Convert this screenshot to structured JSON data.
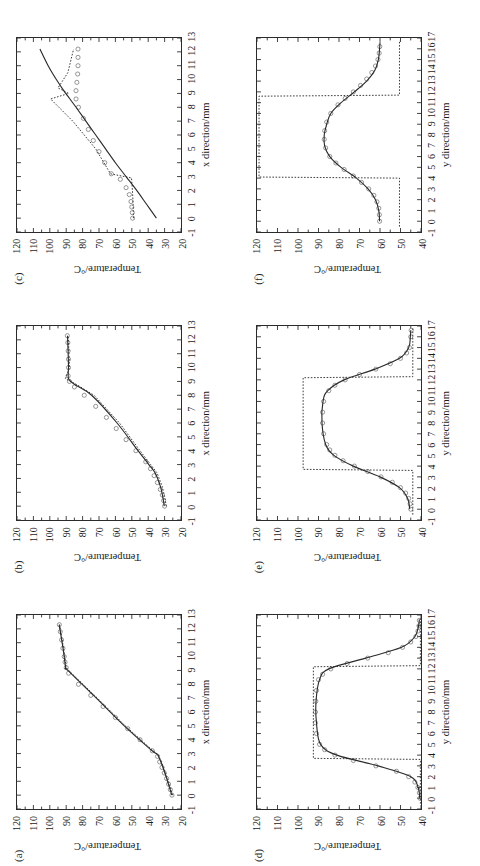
{
  "figure": {
    "orientation": "rotated-90-ccw",
    "panel_count": 6,
    "legend": {
      "entries": [
        {
          "label": "COMSOL",
          "style": "circle-marker",
          "color": "#6f6f6f"
        },
        {
          "label": "One-dimensional",
          "style": "dotted-line",
          "color": "#3a3a3a"
        },
        {
          "label": "Bi-layer model",
          "style": "solid-line",
          "color": "#2b2b2b"
        }
      ]
    },
    "axis_titles": {
      "y": "Temperature/°C",
      "x_top_row": "x direction/mm",
      "x_bottom_row": "y direction/mm"
    }
  },
  "chart_data": [
    {
      "id": "a",
      "panel_label": "(a)",
      "type": "line",
      "title": "",
      "annotation": "t = 0.1 mm",
      "xlabel": "x direction/mm",
      "ylabel": "Temperature/°C",
      "xlim": [
        -1,
        13
      ],
      "ylim": [
        20,
        120
      ],
      "xticks": [
        -1,
        0,
        1,
        2,
        3,
        4,
        5,
        6,
        7,
        8,
        9,
        10,
        11,
        12,
        13
      ],
      "yticks": [
        20,
        30,
        40,
        50,
        60,
        70,
        80,
        90,
        100,
        110,
        120
      ],
      "grid": false,
      "legend_position": "upper-left",
      "series": [
        {
          "name": "COMSOL",
          "style": "circle-marker",
          "x": [
            0.0,
            0.4,
            0.8,
            1.2,
            1.6,
            2.0,
            2.4,
            2.8,
            3.2,
            4.0,
            4.8,
            5.6,
            6.4,
            7.2,
            8.0,
            8.8,
            9.2,
            9.6,
            10.0,
            10.6,
            11.2,
            11.8,
            12.3
          ],
          "values": [
            25.5,
            26.5,
            27.6,
            28.8,
            30.2,
            31.6,
            33.0,
            34.3,
            37.5,
            45.0,
            52.5,
            60.0,
            67.5,
            75.0,
            82.5,
            88.5,
            90.0,
            90.7,
            91.2,
            92.0,
            92.8,
            93.6,
            94.2
          ]
        },
        {
          "name": "One-dimensional",
          "style": "dotted-line",
          "x": [
            0.0,
            1.0,
            2.0,
            2.9,
            3.2,
            5.0,
            7.0,
            9.0,
            9.2,
            10.5,
            12.3
          ],
          "values": [
            25.0,
            27.7,
            30.6,
            33.8,
            37.0,
            54.0,
            71.0,
            88.5,
            90.0,
            91.5,
            94.0
          ]
        },
        {
          "name": "Bi-layer model",
          "style": "solid-line",
          "x": [
            0.0,
            1.0,
            2.0,
            2.9,
            3.2,
            5.0,
            7.0,
            9.0,
            9.2,
            10.5,
            12.3
          ],
          "values": [
            25.6,
            28.2,
            31.0,
            34.2,
            37.6,
            54.6,
            71.6,
            89.0,
            90.3,
            91.8,
            94.3
          ]
        }
      ]
    },
    {
      "id": "b",
      "panel_label": "(b)",
      "type": "line",
      "title": "",
      "annotation": "t = 0.5 mm",
      "xlabel": "x direction/mm",
      "ylabel": "Temperature/°C",
      "xlim": [
        -1,
        13
      ],
      "ylim": [
        20,
        120
      ],
      "xticks": [
        -1,
        0,
        1,
        2,
        3,
        4,
        5,
        6,
        7,
        8,
        9,
        10,
        11,
        12,
        13
      ],
      "yticks": [
        20,
        30,
        40,
        50,
        60,
        70,
        80,
        90,
        100,
        110,
        120
      ],
      "grid": false,
      "legend_position": "upper-left",
      "series": [
        {
          "name": "COMSOL",
          "style": "circle-marker",
          "x": [
            0.0,
            0.4,
            0.8,
            1.2,
            1.7,
            2.2,
            2.7,
            3.2,
            4.0,
            4.8,
            5.6,
            6.4,
            7.2,
            8.0,
            8.6,
            9.0,
            9.4,
            10.0,
            10.6,
            11.2,
            11.8,
            12.3
          ],
          "values": [
            30.0,
            30.6,
            31.4,
            32.6,
            34.4,
            36.4,
            38.6,
            41.5,
            47.5,
            53.5,
            59.5,
            65.5,
            72.0,
            79.0,
            85.0,
            88.0,
            88.8,
            88.6,
            88.6,
            88.8,
            89.0,
            89.3
          ]
        },
        {
          "name": "One-dimensional",
          "style": "dotted-line",
          "x": [
            0.0,
            0.6,
            1.4,
            2.4,
            3.0,
            4.0,
            6.0,
            8.0,
            8.8,
            9.2,
            10.0,
            11.0,
            12.3
          ],
          "values": [
            29.0,
            29.8,
            31.4,
            34.6,
            38.5,
            45.0,
            57.5,
            73.0,
            84.0,
            90.5,
            88.0,
            88.3,
            88.8
          ]
        },
        {
          "name": "Bi-layer model",
          "style": "solid-line",
          "x": [
            0.0,
            0.6,
            1.4,
            2.4,
            3.0,
            4.0,
            6.0,
            8.0,
            8.8,
            9.2,
            10.0,
            11.0,
            12.3
          ],
          "values": [
            30.2,
            31.0,
            32.5,
            35.8,
            39.6,
            46.2,
            59.0,
            74.5,
            85.0,
            88.6,
            88.6,
            88.8,
            89.2
          ]
        }
      ]
    },
    {
      "id": "c",
      "panel_label": "(c)",
      "type": "line",
      "title": "",
      "annotation": "t = 2.0 mm",
      "xlabel": "x direction/mm",
      "ylabel": "Temperature/°C",
      "xlim": [
        -1,
        13
      ],
      "ylim": [
        20,
        120
      ],
      "xticks": [
        -1,
        0,
        1,
        2,
        3,
        4,
        5,
        6,
        7,
        8,
        9,
        10,
        11,
        12,
        13
      ],
      "yticks": [
        20,
        30,
        40,
        50,
        60,
        70,
        80,
        90,
        100,
        110,
        120
      ],
      "grid": false,
      "legend_position": "upper-left",
      "series": [
        {
          "name": "COMSOL",
          "style": "circle-marker",
          "x": [
            0.0,
            0.4,
            0.8,
            1.2,
            1.7,
            2.2,
            2.8,
            3.2,
            4.0,
            4.8,
            5.6,
            6.4,
            7.2,
            8.0,
            8.6,
            9.2,
            9.8,
            10.4,
            11.0,
            11.6,
            12.2
          ],
          "values": [
            49.5,
            49.7,
            50.0,
            50.5,
            51.5,
            53.5,
            57.0,
            62.5,
            66.5,
            70.0,
            73.5,
            76.5,
            79.5,
            82.5,
            84.0,
            84.0,
            83.5,
            83.0,
            82.8,
            82.8,
            82.8
          ]
        },
        {
          "name": "One-dimensional",
          "style": "dotted-line",
          "x": [
            0.0,
            1.0,
            2.0,
            2.9,
            3.2,
            5.0,
            7.0,
            8.6,
            9.0,
            9.4,
            10.5,
            12.2
          ],
          "values": [
            49.0,
            49.2,
            49.6,
            50.2,
            63.0,
            72.0,
            86.0,
            99.5,
            88.5,
            95.0,
            89.0,
            85.5
          ]
        },
        {
          "name": "Bi-layer model",
          "style": "solid-line",
          "x": [
            0.0,
            1.0,
            2.0,
            3.0,
            4.0,
            5.0,
            6.0,
            7.0,
            8.0,
            8.8,
            9.2,
            10.0,
            11.0,
            12.2
          ],
          "values": [
            35.0,
            41.0,
            47.0,
            53.5,
            60.0,
            66.0,
            72.0,
            78.0,
            84.0,
            89.0,
            91.5,
            96.0,
            101.0,
            106.0
          ]
        }
      ]
    },
    {
      "id": "d",
      "panel_label": "(d)",
      "type": "line",
      "title": "",
      "annotation": "t = 0.1 mm",
      "xlabel": "y direction/mm",
      "ylabel": "Temperature/°C",
      "xlim": [
        -1,
        17
      ],
      "ylim": [
        40,
        120
      ],
      "xticks": [
        -1,
        0,
        1,
        2,
        3,
        4,
        5,
        6,
        7,
        8,
        9,
        10,
        11,
        12,
        13,
        14,
        15,
        16,
        17
      ],
      "yticks": [
        40,
        50,
        60,
        70,
        80,
        90,
        100,
        110,
        120
      ],
      "grid": false,
      "legend_position": "upper-left",
      "series": [
        {
          "name": "COMSOL",
          "style": "circle-marker",
          "x": [
            0.0,
            0.5,
            1.0,
            1.5,
            2.0,
            2.5,
            3.0,
            3.5,
            4.0,
            4.5,
            5.0,
            6.0,
            7.0,
            8.0,
            9.0,
            10.0,
            11.0,
            11.5,
            12.0,
            12.5,
            13.0,
            13.5,
            14.0,
            14.5,
            15.0,
            15.5,
            16.0,
            16.5
          ],
          "values": [
            40.5,
            40.8,
            41.5,
            43.0,
            46.0,
            52.0,
            62.0,
            73.0,
            82.0,
            87.0,
            89.5,
            91.0,
            91.5,
            91.5,
            91.3,
            91.0,
            90.0,
            88.0,
            84.0,
            76.0,
            66.0,
            56.0,
            49.0,
            45.0,
            42.5,
            41.5,
            41.0,
            40.8
          ]
        },
        {
          "name": "One-dimensional",
          "style": "dotted-line",
          "x": [
            -0.5,
            3.6,
            3.7,
            12.2,
            12.3,
            16.8
          ],
          "values": [
            40.3,
            40.3,
            92.5,
            92.5,
            40.3,
            40.3
          ]
        },
        {
          "name": "Bi-layer model",
          "style": "solid-line",
          "x": [
            0.0,
            1.0,
            2.0,
            3.0,
            4.0,
            5.0,
            7.0,
            9.0,
            11.0,
            12.0,
            13.0,
            14.0,
            15.0,
            16.0,
            16.6
          ],
          "values": [
            40.6,
            41.4,
            45.0,
            61.0,
            81.0,
            89.0,
            91.0,
            91.2,
            89.5,
            85.0,
            67.0,
            49.5,
            43.0,
            41.2,
            40.8
          ]
        }
      ]
    },
    {
      "id": "e",
      "panel_label": "(e)",
      "type": "line",
      "title": "",
      "annotation": "t = 0.5 mm",
      "xlabel": "y direction/mm",
      "ylabel": "Temperature/°C",
      "xlim": [
        -1,
        17
      ],
      "ylim": [
        40,
        120
      ],
      "xticks": [
        -1,
        0,
        1,
        2,
        3,
        4,
        5,
        6,
        7,
        8,
        9,
        10,
        11,
        12,
        13,
        14,
        15,
        16,
        17
      ],
      "yticks": [
        40,
        50,
        60,
        70,
        80,
        90,
        100,
        110,
        120
      ],
      "grid": false,
      "legend_position": "upper-left",
      "series": [
        {
          "name": "COMSOL",
          "style": "circle-marker",
          "x": [
            0.0,
            0.5,
            1.0,
            1.5,
            2.0,
            2.5,
            3.0,
            3.5,
            4.0,
            4.5,
            5.0,
            5.5,
            6.0,
            7.0,
            8.0,
            9.0,
            10.0,
            11.0,
            11.5,
            12.0,
            12.5,
            13.0,
            13.5,
            14.0,
            14.5,
            15.0,
            16.0,
            16.6
          ],
          "values": [
            45.0,
            45.3,
            46.0,
            47.5,
            50.0,
            54.0,
            59.5,
            66.0,
            72.5,
            78.0,
            82.0,
            84.5,
            86.0,
            87.5,
            88.0,
            88.0,
            87.5,
            85.0,
            82.0,
            77.0,
            70.0,
            62.0,
            55.0,
            50.0,
            47.0,
            45.6,
            45.0,
            44.8
          ]
        },
        {
          "name": "One-dimensional",
          "style": "dotted-line",
          "x": [
            -0.5,
            3.6,
            3.7,
            12.2,
            12.3,
            16.8
          ],
          "values": [
            44.0,
            44.0,
            97.5,
            97.5,
            44.0,
            44.0
          ]
        },
        {
          "name": "Bi-layer model",
          "style": "solid-line",
          "x": [
            0.0,
            1.0,
            2.0,
            3.0,
            4.0,
            5.0,
            6.0,
            8.0,
            10.0,
            11.0,
            12.0,
            13.0,
            14.0,
            15.0,
            16.0,
            16.6
          ],
          "values": [
            45.5,
            46.5,
            50.5,
            60.0,
            73.0,
            82.5,
            86.5,
            88.3,
            87.8,
            85.5,
            77.5,
            62.5,
            50.5,
            46.0,
            45.2,
            45.0
          ]
        }
      ]
    },
    {
      "id": "f",
      "panel_label": "(f)",
      "type": "line",
      "title": "",
      "annotation": "t = 2.0 mm",
      "xlabel": "y direction/mm",
      "ylabel": "Temperature/°C",
      "xlim": [
        -1,
        17
      ],
      "ylim": [
        40,
        120
      ],
      "xticks": [
        -1,
        0,
        1,
        2,
        3,
        4,
        5,
        6,
        7,
        8,
        9,
        10,
        11,
        12,
        13,
        14,
        15,
        16,
        17
      ],
      "yticks": [
        40,
        50,
        60,
        70,
        80,
        90,
        100,
        110,
        120
      ],
      "grid": false,
      "legend_position": "upper-left",
      "series": [
        {
          "name": "COMSOL",
          "style": "circle-marker",
          "x": [
            0.0,
            0.6,
            1.2,
            1.8,
            2.4,
            3.0,
            3.6,
            4.2,
            4.8,
            5.4,
            6.0,
            6.8,
            7.6,
            8.4,
            9.2,
            10.0,
            10.8,
            11.4,
            12.0,
            12.6,
            13.2,
            13.8,
            14.4,
            15.0,
            15.6,
            16.2
          ],
          "values": [
            60.2,
            60.3,
            60.6,
            61.5,
            63.0,
            65.5,
            69.0,
            73.0,
            77.5,
            81.5,
            84.5,
            86.5,
            87.2,
            87.0,
            86.0,
            84.0,
            80.5,
            77.0,
            73.0,
            69.5,
            66.5,
            64.0,
            62.2,
            61.0,
            60.4,
            60.1
          ]
        },
        {
          "name": "One-dimensional",
          "style": "dotted-line",
          "x": [
            -0.5,
            4.0,
            4.1,
            11.6,
            11.7,
            16.8
          ],
          "values": [
            50.5,
            50.5,
            119.0,
            119.0,
            50.5,
            50.5
          ]
        },
        {
          "name": "Bi-layer model",
          "style": "solid-line",
          "x": [
            0.0,
            1.0,
            2.0,
            3.0,
            4.0,
            5.0,
            6.0,
            7.0,
            8.0,
            9.0,
            10.0,
            11.0,
            12.0,
            13.0,
            14.0,
            15.0,
            16.0,
            16.6
          ],
          "values": [
            60.2,
            60.6,
            62.2,
            65.8,
            71.5,
            79.0,
            84.5,
            87.0,
            87.2,
            86.0,
            84.0,
            79.0,
            72.5,
            66.5,
            62.5,
            60.8,
            60.2,
            60.0
          ]
        }
      ]
    }
  ]
}
